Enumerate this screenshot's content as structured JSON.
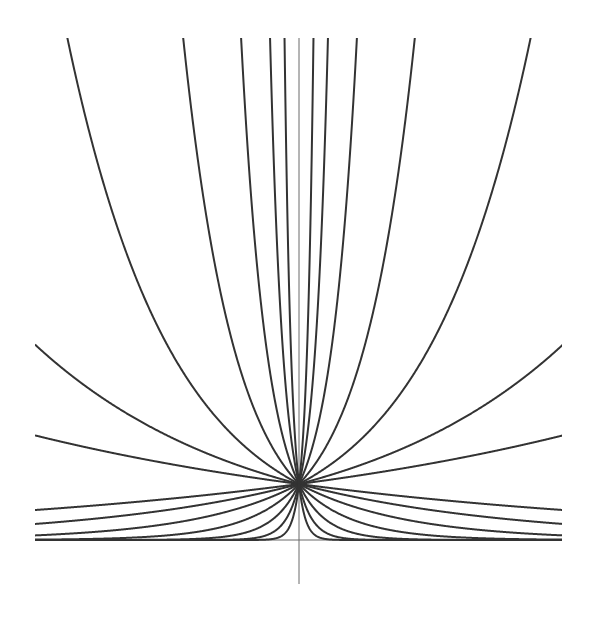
{
  "chart_data": {
    "type": "line",
    "title": "",
    "xlabel": "",
    "ylabel": "",
    "function": "y = exp(k * |x|)",
    "k_values": [
      1,
      2,
      4,
      8,
      16,
      32,
      64,
      -1,
      -2,
      -4,
      -8,
      -16,
      -32,
      -64
    ],
    "xlim": [
      -0.625,
      0.625
    ],
    "ylim": [
      0,
      8.96
    ],
    "grid": false,
    "legend": null,
    "axes": {
      "x_axis_at_y": 0,
      "y_axis_at_x": 0,
      "y_axis_extends_below": true
    },
    "series": [
      {
        "name": "k=1",
        "k": 1,
        "value_at_edge": 1.87
      },
      {
        "name": "k=2",
        "k": 2,
        "value_at_edge": 3.49
      },
      {
        "name": "k=4",
        "k": 4,
        "value_at_edge": 12.18
      },
      {
        "name": "k=8",
        "k": 8,
        "value_at_edge": 148.4
      },
      {
        "name": "k=16",
        "k": 16,
        "value_at_edge": 22026
      },
      {
        "name": "k=32",
        "k": 32,
        "value_at_edge": 485000000.0
      },
      {
        "name": "k=64",
        "k": 64,
        "value_at_edge": 2.35e+17
      },
      {
        "name": "k=-1",
        "k": -1,
        "value_at_edge": 0.535
      },
      {
        "name": "k=-2",
        "k": -2,
        "value_at_edge": 0.287
      },
      {
        "name": "k=-4",
        "k": -4,
        "value_at_edge": 0.082
      },
      {
        "name": "k=-8",
        "k": -8,
        "value_at_edge": 0.0067
      },
      {
        "name": "k=-16",
        "k": -16,
        "value_at_edge": 5e-05
      },
      {
        "name": "k=-32",
        "k": -32,
        "value_at_edge": 0.0
      },
      {
        "name": "k=-64",
        "k": -64,
        "value_at_edge": 0.0
      }
    ],
    "line_color": "#333333",
    "axis_color": "#6a6a6a"
  },
  "layout": {
    "origin_px": [
      299,
      540
    ],
    "x_scale_px_per_unit": 422.4,
    "y_scale_px_per_unit": 56,
    "y_axis_top_px": 38,
    "y_axis_bottom_px": 584,
    "x_axis_left_px": 35,
    "x_axis_right_px": 562
  }
}
